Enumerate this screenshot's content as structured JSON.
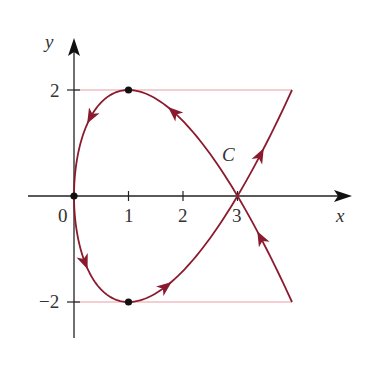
{
  "figure": {
    "axes": {
      "x_label": "x",
      "y_label": "y",
      "x_ticks": [
        {
          "value": 0,
          "label": "0"
        },
        {
          "value": 1,
          "label": "1"
        },
        {
          "value": 2,
          "label": "2"
        },
        {
          "value": 3,
          "label": "3"
        }
      ],
      "y_ticks": [
        {
          "value": 2,
          "label": "2"
        },
        {
          "value": -2,
          "label": "−2"
        }
      ]
    },
    "curve": {
      "label": "C",
      "param": {
        "t_min": -2,
        "t_max": 2
      },
      "color": "#8b1a2e",
      "direction": "increasing t",
      "key_points": [
        {
          "x": 4,
          "y": -2,
          "marked": false
        },
        {
          "x": 3,
          "y": 0,
          "marked": false
        },
        {
          "x": 1,
          "y": 2,
          "marked": true
        },
        {
          "x": 0,
          "y": 0,
          "marked": true
        },
        {
          "x": 1,
          "y": -2,
          "marked": true
        },
        {
          "x": 3,
          "y": 0,
          "marked": false
        },
        {
          "x": 4,
          "y": 2,
          "marked": false
        }
      ]
    },
    "reference_lines": [
      {
        "y": 2,
        "x_from": 0,
        "x_to": 4,
        "color": "#e8a0a8"
      },
      {
        "y": -2,
        "x_from": 0,
        "x_to": 4,
        "color": "#e8a0a8"
      }
    ],
    "colors": {
      "axis": "#222222",
      "curve": "#8b1a2e",
      "guide": "#e8a0a8",
      "point": "#111111"
    }
  }
}
